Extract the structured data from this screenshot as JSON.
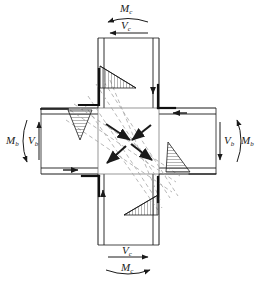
{
  "figure": {
    "kind": "beam-column-joint-panel-zone",
    "background_color": "#ffffff",
    "line_color": "#1a1a1a",
    "strut_color": "#9a9a9a",
    "hatch_color": "#2a2a2a"
  },
  "labels": {
    "top": {
      "moment": "M",
      "moment_sub": "c",
      "shear": "V",
      "shear_sub": "c",
      "moment_arrow": "curved-left",
      "shear_arrow": "straight-left"
    },
    "bottom": {
      "shear": "V",
      "shear_sub": "c",
      "moment": "M",
      "moment_sub": "c",
      "shear_arrow": "straight-right",
      "moment_arrow": "curved-right"
    },
    "left": {
      "moment": "M",
      "moment_sub": "b",
      "shear": "V",
      "shear_sub": "b",
      "moment_arrow": "curved-down",
      "shear_arrow": "straight-up"
    },
    "right": {
      "shear": "V",
      "shear_sub": "b",
      "moment": "M",
      "moment_sub": "b",
      "shear_arrow": "straight-down",
      "moment_arrow": "curved-up"
    }
  },
  "members": {
    "column": {
      "name": "column",
      "x_left": 98,
      "x_right": 159,
      "y_top": 38,
      "y_bottom": 245,
      "flange_offset": 5
    },
    "beam": {
      "name": "beam",
      "y_top": 108,
      "y_bottom": 174,
      "x_left": 41,
      "x_right": 216,
      "flange_offset": 5
    },
    "panel_zone": {
      "name": "panel-zone",
      "x": 98,
      "y": 108,
      "w": 61,
      "h": 66
    }
  },
  "stress_blocks": [
    {
      "name": "stress-block-top-left",
      "position": "top-left",
      "orientation": "right"
    },
    {
      "name": "stress-block-left",
      "position": "left-upper",
      "orientation": "down"
    },
    {
      "name": "stress-block-right",
      "position": "right-lower",
      "orientation": "up"
    },
    {
      "name": "stress-block-bottom",
      "position": "bottom-right",
      "orientation": "left"
    }
  ],
  "struts": {
    "name": "diagonal-compression-struts",
    "style": "dashed",
    "count": 8,
    "arrows": 4
  }
}
